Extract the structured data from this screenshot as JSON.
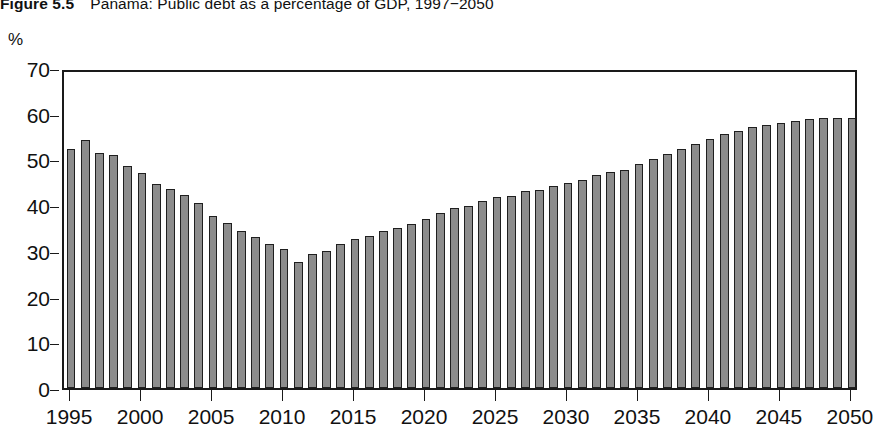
{
  "figure": {
    "number": "Figure 5.5",
    "title": "Panama: Public debt as a percentage of GDP, 1997−2050",
    "unit_label": "%"
  },
  "chart_data": {
    "type": "bar",
    "title": "Panama: Public debt as a percentage of GDP, 1997−2050",
    "xlabel": "",
    "ylabel": "%",
    "ylim": [
      0,
      70
    ],
    "xlim": [
      1994.5,
      2050.5
    ],
    "ytick_values": [
      0,
      10,
      20,
      30,
      40,
      50,
      60,
      70
    ],
    "ytick_labels": [
      "0",
      "10",
      "20",
      "30",
      "40",
      "50",
      "60",
      "70"
    ],
    "xtick_values": [
      1995,
      2000,
      2005,
      2010,
      2015,
      2020,
      2025,
      2030,
      2035,
      2040,
      2045,
      2050
    ],
    "xtick_labels": [
      "1995",
      "2000",
      "2005",
      "2010",
      "2015",
      "2020",
      "2025",
      "2030",
      "2035",
      "2040",
      "2045",
      "2050"
    ],
    "grid": false,
    "legend": null,
    "bar_color": "#8c8c8c",
    "bar_edge_color": "#1f1f1f",
    "axis_color": "#1a1a1a",
    "categories": [
      "1995",
      "1996",
      "1997",
      "1998",
      "1999",
      "2000",
      "2001",
      "2002",
      "2003",
      "2004",
      "2005",
      "2006",
      "2007",
      "2008",
      "2009",
      "2010",
      "2011",
      "2012",
      "2013",
      "2014",
      "2015",
      "2016",
      "2017",
      "2018",
      "2019",
      "2020",
      "2021",
      "2022",
      "2023",
      "2024",
      "2025",
      "2026",
      "2027",
      "2028",
      "2029",
      "2030",
      "2031",
      "2032",
      "2033",
      "2034",
      "2035",
      "2036",
      "2037",
      "2038",
      "2039",
      "2040",
      "2041",
      "2042",
      "2043",
      "2044",
      "2045",
      "2046",
      "2047",
      "2048",
      "2049",
      "2050"
    ],
    "values": [
      52.3,
      54.2,
      51.5,
      51.0,
      48.6,
      47.0,
      44.6,
      43.6,
      42.3,
      40.4,
      37.6,
      36.0,
      34.4,
      33.0,
      31.5,
      30.4,
      27.5,
      29.3,
      30.0,
      31.6,
      32.7,
      33.3,
      34.4,
      35.1,
      35.9,
      37.0,
      38.2,
      39.4,
      39.9,
      41.0,
      41.7,
      42.0,
      43.0,
      43.4,
      44.3,
      44.8,
      45.5,
      46.6,
      47.3,
      47.8,
      48.9,
      50.0,
      51.3,
      52.3,
      53.4,
      54.4,
      55.5,
      56.2,
      57.0,
      57.5,
      58.0,
      58.5,
      58.8,
      59.0,
      59.0,
      59.0
    ]
  }
}
